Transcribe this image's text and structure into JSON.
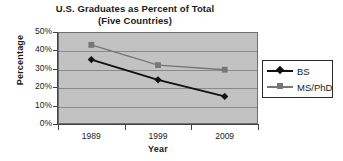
{
  "chart_data": {
    "type": "line",
    "title": "U.S. Graduates as Percent of Total",
    "subtitle": "(Five Countries)",
    "xlabel": "Year",
    "ylabel": "Percentage",
    "categories": [
      "1989",
      "1999",
      "2009"
    ],
    "x": [
      1989,
      1999,
      2009
    ],
    "series": [
      {
        "name": "BS",
        "values": [
          35,
          24,
          15
        ],
        "color": "#111111",
        "marker": "diamond"
      },
      {
        "name": "MS/PhD",
        "values": [
          43,
          32,
          29.5
        ],
        "color": "#767676",
        "marker": "square"
      }
    ],
    "ylim": [
      0,
      50
    ],
    "ytick_labels": [
      "50%",
      "40%",
      "30%",
      "20%",
      "10%",
      "0%"
    ],
    "ytick_values": [
      50,
      40,
      30,
      20,
      10,
      0
    ],
    "grid": true,
    "legend_position": "right",
    "plot_background": "#c2c2c2"
  },
  "legend": {
    "entries": [
      {
        "label": "BS"
      },
      {
        "label": "MS/PhD"
      }
    ]
  }
}
